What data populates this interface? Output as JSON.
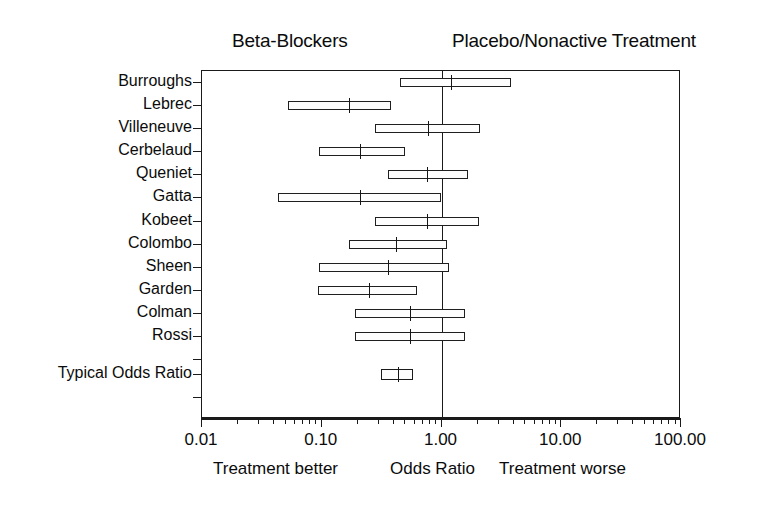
{
  "headers": {
    "left_group": "Beta-Blockers",
    "right_group": "Placebo/Nonactive Treatment"
  },
  "axis": {
    "caption_left": "Treatment better",
    "caption_center": "Odds Ratio",
    "caption_right": "Treatment worse",
    "tick_labels": [
      "0.01",
      "0.10",
      "1.00",
      "10.00",
      "100.00"
    ]
  },
  "chart_data": {
    "type": "scatter",
    "subtype": "forest-plot",
    "title": "",
    "xlabel": "Odds Ratio",
    "ylabel": "",
    "xscale": "log",
    "xlim": [
      0.01,
      100.0
    ],
    "xticks": [
      0.01,
      0.1,
      1.0,
      10.0,
      100.0
    ],
    "xtick_labels": [
      "0.01",
      "0.10",
      "1.00",
      "10.00",
      "100.00"
    ],
    "grid": false,
    "legend": "none",
    "reference_line": 1.0,
    "left_group_label": "Beta-Blockers",
    "right_group_label": "Placebo/Nonactive Treatment",
    "annotations": [
      "Treatment better",
      "Odds Ratio",
      "Treatment worse"
    ],
    "columns": [
      "study",
      "odds_ratio",
      "ci_low",
      "ci_high"
    ],
    "rows": [
      {
        "study": "Burroughs",
        "odds_ratio": 1.2,
        "ci_low": 0.45,
        "ci_high": 3.8
      },
      {
        "study": "Lebrec",
        "odds_ratio": 0.17,
        "ci_low": 0.052,
        "ci_high": 0.38
      },
      {
        "study": "Villeneuve",
        "odds_ratio": 0.77,
        "ci_low": 0.28,
        "ci_high": 2.1
      },
      {
        "study": "Cerbelaud",
        "odds_ratio": 0.21,
        "ci_low": 0.095,
        "ci_high": 0.5
      },
      {
        "study": "Queniet",
        "odds_ratio": 0.76,
        "ci_low": 0.36,
        "ci_high": 1.65
      },
      {
        "study": "Gatta",
        "odds_ratio": 0.21,
        "ci_low": 0.043,
        "ci_high": 0.99
      },
      {
        "study": "Kobeet",
        "odds_ratio": 0.76,
        "ci_low": 0.28,
        "ci_high": 2.05
      },
      {
        "study": "Colombo",
        "odds_ratio": 0.42,
        "ci_low": 0.17,
        "ci_high": 1.12
      },
      {
        "study": "Sheen",
        "odds_ratio": 0.36,
        "ci_low": 0.095,
        "ci_high": 1.15
      },
      {
        "study": "Garden",
        "odds_ratio": 0.25,
        "ci_low": 0.093,
        "ci_high": 0.62
      },
      {
        "study": "Colman",
        "odds_ratio": 0.55,
        "ci_low": 0.19,
        "ci_high": 1.58
      },
      {
        "study": "Rossi",
        "odds_ratio": 0.55,
        "ci_low": 0.19,
        "ci_high": 1.58
      },
      {
        "study": "Typical Odds Ratio",
        "odds_ratio": 0.43,
        "ci_low": 0.31,
        "ci_high": 0.58,
        "summary": true
      }
    ]
  },
  "colors": {
    "ink": "#1a1a1a",
    "background": "#ffffff",
    "bar_fill": "#fdfdfd"
  }
}
